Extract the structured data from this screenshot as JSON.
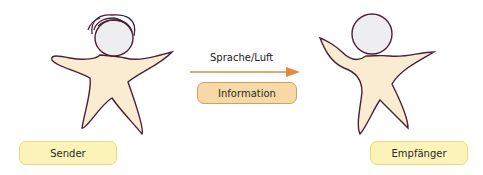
{
  "diagram": {
    "sender": {
      "label": "Sender"
    },
    "receiver": {
      "label": "Empfänger"
    },
    "channel": {
      "label": "Sprache/Luft"
    },
    "message": {
      "label": "Information"
    }
  },
  "colors": {
    "body_fill": "#faecd0",
    "outline": "#4a1f3a",
    "head_fill": "#eeeef0",
    "arrow": "#e08a3c",
    "yellow_box": "#fbf3b8",
    "orange_box": "#f6d9a4"
  }
}
